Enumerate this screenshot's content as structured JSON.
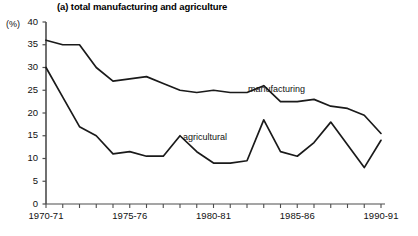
{
  "chart_data": {
    "type": "line",
    "title": "(a) total manufacturing and agriculture",
    "xlabel": "",
    "ylabel": "(%)",
    "ylim": [
      0,
      40
    ],
    "yticks": [
      0,
      5,
      10,
      15,
      20,
      25,
      30,
      35,
      40
    ],
    "grid": false,
    "legend_position": "inline-annotation",
    "categories": [
      "1970-71",
      "1971-72",
      "1972-73",
      "1973-74",
      "1974-75",
      "1975-76",
      "1976-77",
      "1977-78",
      "1978-79",
      "1979-80",
      "1980-81",
      "1981-82",
      "1982-83",
      "1983-84",
      "1984-85",
      "1985-86",
      "1986-87",
      "1987-88",
      "1988-89",
      "1989-90",
      "1990-91"
    ],
    "xtick_labels": [
      "1970-71",
      "1975-76",
      "1980-81",
      "1985-86",
      "1990-91"
    ],
    "xtick_label_indices": [
      0,
      5,
      10,
      15,
      20
    ],
    "series": [
      {
        "name": "manufacturing",
        "values": [
          36.0,
          35.0,
          35.0,
          30.0,
          27.0,
          27.5,
          28.0,
          26.5,
          25.0,
          24.5,
          25.0,
          24.5,
          24.5,
          26.0,
          22.5,
          22.5,
          23.0,
          21.5,
          21.0,
          19.5,
          15.5
        ]
      },
      {
        "name": "agricultural",
        "values": [
          30.0,
          23.5,
          17.0,
          15.0,
          11.0,
          11.5,
          10.5,
          10.5,
          15.0,
          11.5,
          9.0,
          9.0,
          9.5,
          18.5,
          11.5,
          10.5,
          13.5,
          18.0,
          13.0,
          8.0,
          14.0
        ]
      }
    ],
    "annotations": [
      {
        "text": "manufacturing",
        "x_index": 13,
        "value": 24.5
      },
      {
        "text": "agricultural",
        "x_index": 8,
        "value": 15.0
      }
    ]
  },
  "axis": {
    "y_unit": "(%)",
    "y_labels": [
      "40",
      "35",
      "30",
      "25",
      "20",
      "15",
      "10",
      "5",
      "0"
    ],
    "x_labels": [
      "1970-71",
      "1975-76",
      "1980-81",
      "1985-86",
      "1990-91"
    ]
  },
  "labels": {
    "manufacturing": "manufacturing",
    "agricultural": "agricultural"
  },
  "title": "(a) total manufacturing and agriculture",
  "colors": {
    "line": "#1a1a1a",
    "axis": "#4d4d4d",
    "background": "#ffffff"
  }
}
